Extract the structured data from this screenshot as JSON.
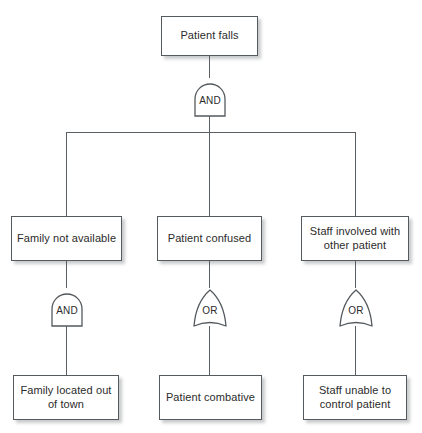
{
  "diagram": {
    "type": "fault-tree",
    "colors": {
      "box_border": "#555a5e",
      "box_fill": "#ffffff",
      "wire": "#5a5f63",
      "text": "#2b2b2b",
      "shadow": "rgba(120,125,130,0.40)"
    },
    "nodes": {
      "top_event": {
        "label": "Patient falls"
      },
      "gate_top": {
        "label": "AND",
        "gate_type": "AND"
      },
      "intermediate": [
        {
          "label": "Family not available"
        },
        {
          "label": "Patient confused"
        },
        {
          "label": "Staff involved with other patient"
        }
      ],
      "gates_level2": [
        {
          "label": "AND",
          "gate_type": "AND"
        },
        {
          "label": "OR",
          "gate_type": "OR"
        },
        {
          "label": "OR",
          "gate_type": "OR"
        }
      ],
      "basic_events": [
        {
          "label": "Family located out of town"
        },
        {
          "label": "Patient combative"
        },
        {
          "label": "Staff unable to control patient"
        }
      ]
    }
  }
}
